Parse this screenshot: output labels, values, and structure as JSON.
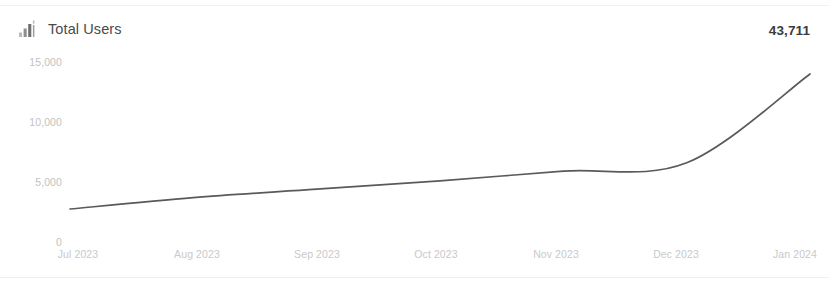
{
  "card": {
    "icon": "bar-chart-icon",
    "title": "Total Users",
    "value": "43,711"
  },
  "chart_data": {
    "type": "line",
    "title": "Total Users",
    "xlabel": "",
    "ylabel": "",
    "grid": false,
    "legend": false,
    "line_color": "#5a5a5a",
    "categories": [
      "Jul 2023",
      "Aug 2023",
      "Sep 2023",
      "Oct 2023",
      "Nov 2023",
      "Dec 2023",
      "Jan 2024"
    ],
    "x_tick_labels": [
      "Jul 2023",
      "Aug 2023",
      "Sep 2023",
      "Oct 2023",
      "Nov 2023",
      "Dec 2023",
      "Jan 2024"
    ],
    "y_tick_labels": [
      "15,000",
      "10,000",
      "5,000",
      "0"
    ],
    "y_tick_values": [
      15000,
      10000,
      5000,
      0
    ],
    "ylim": [
      0,
      15000
    ],
    "values": [
      2750,
      3700,
      4400,
      5100,
      5900,
      6600,
      14000
    ],
    "series": [
      {
        "name": "Total Users",
        "values": [
          2750,
          3700,
          4400,
          5100,
          5900,
          6600,
          14000
        ]
      }
    ],
    "points": [
      {
        "x": "Jul 2023",
        "y": 2750
      },
      {
        "x": "Aug 2023",
        "y": 3700
      },
      {
        "x": "Sep 2023",
        "y": 4400
      },
      {
        "x": "Oct 2023",
        "y": 5100
      },
      {
        "x": "Nov 2023",
        "y": 5900
      },
      {
        "x": "Dec 2023",
        "y": 6600
      },
      {
        "x": "Jan 2024",
        "y": 14000
      }
    ]
  }
}
